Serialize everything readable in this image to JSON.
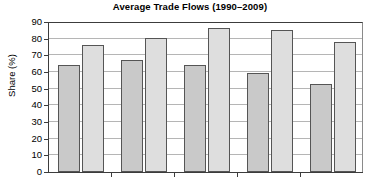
{
  "chart_data": {
    "type": "bar",
    "title": "Average Trade Flows (1990–2009)",
    "xlabel": "",
    "ylabel": "Share (%)",
    "ylim": [
      0,
      90
    ],
    "ytick_labels": [
      "0",
      "10",
      "20",
      "30",
      "40",
      "50",
      "60",
      "70",
      "80",
      "90"
    ],
    "ytick_values": [
      0,
      10,
      20,
      30,
      40,
      50,
      60,
      70,
      80,
      90
    ],
    "xtick_labels": [
      "",
      "",
      "",
      "",
      ""
    ],
    "grid": "horizontal",
    "legend": "none",
    "categories": [
      "1",
      "2",
      "3",
      "4",
      "5"
    ],
    "series": [
      {
        "name": "Series 1",
        "color": "#c9c9c9",
        "values": [
          64.5,
          67.0,
          64.0,
          59.5,
          53.0
        ]
      },
      {
        "name": "Series 2",
        "color": "#dedede",
        "values": [
          76.5,
          80.5,
          86.5,
          85.5,
          78.0
        ]
      }
    ]
  }
}
